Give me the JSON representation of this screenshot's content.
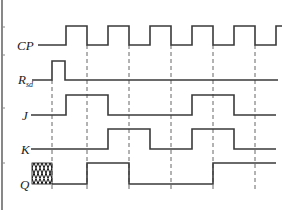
{
  "diagram": {
    "type": "timing-diagram",
    "signals": [
      {
        "name": "CP",
        "label": "CP",
        "subscript": "",
        "low_y": 45,
        "high_y": 26,
        "start_x": 38,
        "end_x": 282,
        "transitions": [
          {
            "x": 66,
            "level": "high"
          },
          {
            "x": 87,
            "level": "low"
          },
          {
            "x": 108,
            "level": "high"
          },
          {
            "x": 129,
            "level": "low"
          },
          {
            "x": 150,
            "level": "high"
          },
          {
            "x": 171,
            "level": "low"
          },
          {
            "x": 192,
            "level": "high"
          },
          {
            "x": 213,
            "level": "low"
          },
          {
            "x": 234,
            "level": "high"
          },
          {
            "x": 255,
            "level": "low"
          },
          {
            "x": 276,
            "level": "high"
          }
        ],
        "initial": "low"
      },
      {
        "name": "Rsd",
        "label": "R",
        "subscript": "sd",
        "low_y": 80,
        "high_y": 61,
        "start_x": 32,
        "end_x": 278,
        "transitions": [
          {
            "x": 52,
            "level": "high"
          },
          {
            "x": 65,
            "level": "low"
          }
        ],
        "initial": "low"
      },
      {
        "name": "J",
        "label": "J",
        "subscript": "",
        "low_y": 115,
        "high_y": 95,
        "start_x": 31,
        "end_x": 276,
        "transitions": [
          {
            "x": 66,
            "level": "high"
          },
          {
            "x": 108,
            "level": "low"
          },
          {
            "x": 192,
            "level": "high"
          },
          {
            "x": 234,
            "level": "low"
          }
        ],
        "initial": "low"
      },
      {
        "name": "K",
        "label": "K",
        "subscript": "",
        "low_y": 149,
        "high_y": 129,
        "start_x": 31,
        "end_x": 276,
        "transitions": [
          {
            "x": 108,
            "level": "high"
          },
          {
            "x": 150,
            "level": "low"
          },
          {
            "x": 192,
            "level": "high"
          },
          {
            "x": 234,
            "level": "low"
          }
        ],
        "initial": "low"
      },
      {
        "name": "Q",
        "label": "Q",
        "subscript": "",
        "low_y": 184,
        "high_y": 163,
        "start_x": 52,
        "end_x": 276,
        "undefined_region": {
          "x1": 32,
          "x2": 52
        },
        "transitions": [
          {
            "x": 87,
            "level": "high"
          },
          {
            "x": 129,
            "level": "low"
          },
          {
            "x": 213,
            "level": "high"
          }
        ],
        "initial": "low"
      }
    ],
    "guide_lines": [
      {
        "x": 52,
        "y1": 80,
        "y2": 192,
        "purpose": "reset-edge"
      },
      {
        "x": 87,
        "y1": 45,
        "y2": 192,
        "purpose": "cp-falling-edge-1"
      },
      {
        "x": 129,
        "y1": 45,
        "y2": 192,
        "purpose": "cp-falling-edge-2"
      },
      {
        "x": 171,
        "y1": 45,
        "y2": 192,
        "purpose": "cp-falling-edge-3"
      },
      {
        "x": 213,
        "y1": 45,
        "y2": 192,
        "purpose": "cp-falling-edge-4"
      },
      {
        "x": 255,
        "y1": 45,
        "y2": 192,
        "purpose": "cp-falling-edge-5"
      }
    ],
    "colors": {
      "wave": "#3a3a3a",
      "guide": "#555555",
      "label": "#222222",
      "background": "#ffffff"
    }
  }
}
